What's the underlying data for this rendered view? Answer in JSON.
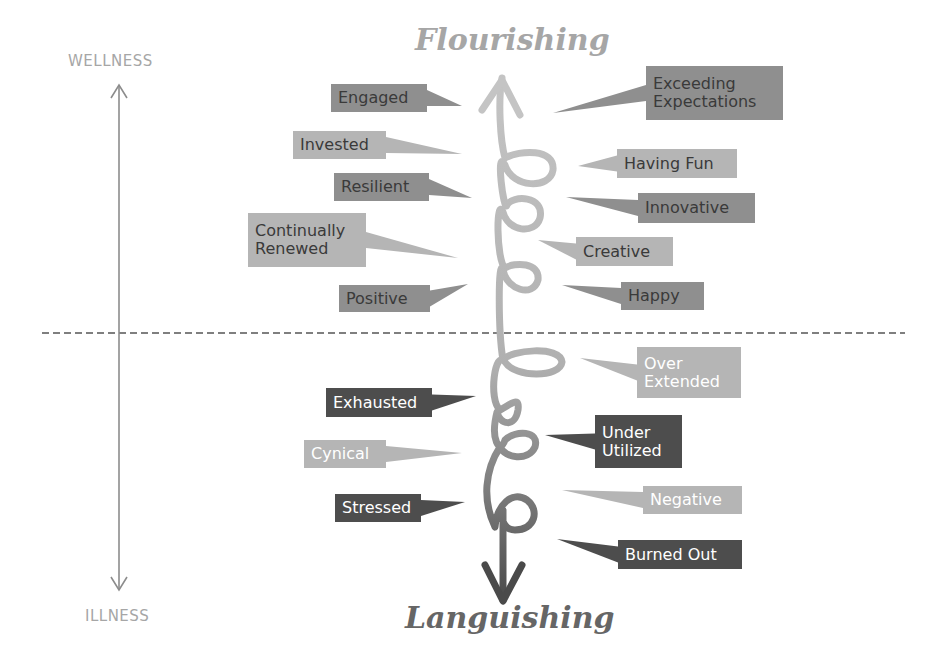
{
  "diagram": {
    "type": "wellness-illness-continuum",
    "top_title": "Flourishing",
    "bottom_title": "Languishing",
    "axis": {
      "top_label": "WELLNESS",
      "bottom_label": "ILLNESS"
    },
    "colors": {
      "top_title": "#a6a6a6",
      "bottom_title": "#666666",
      "axis": "#8c8c8c",
      "dashed_divider": "#7f7f7f",
      "spiral_top": "#bdbdbd",
      "spiral_bottom": "#4d4d4d"
    },
    "positive_labels": [
      {
        "id": "engaged",
        "lines": [
          "Engaged"
        ],
        "side": "left",
        "bg": "#8f8f8f",
        "fg": "#3a3a3a",
        "box": [
          331,
          84,
          96,
          28
        ],
        "tip": [
          462,
          106
        ]
      },
      {
        "id": "invested",
        "lines": [
          "Invested"
        ],
        "side": "left",
        "bg": "#b5b5b5",
        "fg": "#3a3a3a",
        "box": [
          293,
          131,
          93,
          28
        ],
        "tip": [
          462,
          154
        ]
      },
      {
        "id": "resilient",
        "lines": [
          "Resilient"
        ],
        "side": "left",
        "bg": "#8f8f8f",
        "fg": "#3a3a3a",
        "box": [
          334,
          173,
          95,
          28
        ],
        "tip": [
          472,
          198
        ]
      },
      {
        "id": "continually-renewed",
        "lines": [
          "Continually",
          "Renewed"
        ],
        "side": "left",
        "bg": "#b5b5b5",
        "fg": "#3a3a3a",
        "box": [
          248,
          213,
          118,
          54
        ],
        "tip": [
          458,
          258
        ]
      },
      {
        "id": "positive",
        "lines": [
          "Positive"
        ],
        "side": "left",
        "bg": "#8f8f8f",
        "fg": "#3a3a3a",
        "box": [
          339,
          285,
          91,
          27
        ],
        "tip": [
          468,
          284
        ]
      },
      {
        "id": "exceeding-expectations",
        "lines": [
          "Exceeding",
          "Expectations"
        ],
        "side": "right",
        "bg": "#8f8f8f",
        "fg": "#3a3a3a",
        "box": [
          646,
          66,
          137,
          54
        ],
        "tip": [
          553,
          113
        ]
      },
      {
        "id": "having-fun",
        "lines": [
          "Having Fun"
        ],
        "side": "right",
        "bg": "#b5b5b5",
        "fg": "#3a3a3a",
        "box": [
          617,
          149,
          120,
          29
        ],
        "tip": [
          578,
          166
        ]
      },
      {
        "id": "innovative",
        "lines": [
          "Innovative"
        ],
        "side": "right",
        "bg": "#8f8f8f",
        "fg": "#3a3a3a",
        "box": [
          638,
          193,
          117,
          30
        ],
        "tip": [
          566,
          197
        ]
      },
      {
        "id": "creative",
        "lines": [
          "Creative"
        ],
        "side": "right",
        "bg": "#b5b5b5",
        "fg": "#3a3a3a",
        "box": [
          576,
          237,
          97,
          29
        ],
        "tip": [
          538,
          240
        ]
      },
      {
        "id": "happy",
        "lines": [
          "Happy"
        ],
        "side": "right",
        "bg": "#8f8f8f",
        "fg": "#3a3a3a",
        "box": [
          621,
          282,
          83,
          28
        ],
        "tip": [
          562,
          285
        ]
      }
    ],
    "negative_labels": [
      {
        "id": "exhausted",
        "lines": [
          "Exhausted"
        ],
        "side": "left",
        "bg": "#4d4d4d",
        "fg": "#ffffff",
        "box": [
          326,
          388,
          106,
          29
        ],
        "tip": [
          476,
          396
        ]
      },
      {
        "id": "cynical",
        "lines": [
          "Cynical"
        ],
        "side": "left",
        "bg": "#b5b5b5",
        "fg": "#ffffff",
        "box": [
          304,
          440,
          82,
          28
        ],
        "tip": [
          462,
          453
        ]
      },
      {
        "id": "stressed",
        "lines": [
          "Stressed"
        ],
        "side": "left",
        "bg": "#4d4d4d",
        "fg": "#ffffff",
        "box": [
          335,
          494,
          86,
          28
        ],
        "tip": [
          465,
          502
        ]
      },
      {
        "id": "over-extended",
        "lines": [
          "Over",
          "Extended"
        ],
        "side": "right",
        "bg": "#b5b5b5",
        "fg": "#ffffff",
        "box": [
          637,
          347,
          104,
          51
        ],
        "tip": [
          580,
          358
        ]
      },
      {
        "id": "under-utilized",
        "lines": [
          "Under",
          "Utilized"
        ],
        "side": "right",
        "bg": "#4d4d4d",
        "fg": "#ffffff",
        "box": [
          595,
          415,
          87,
          53
        ],
        "tip": [
          545,
          435
        ]
      },
      {
        "id": "negative",
        "lines": [
          "Negative"
        ],
        "side": "right",
        "bg": "#b5b5b5",
        "fg": "#ffffff",
        "box": [
          643,
          486,
          99,
          28
        ],
        "tip": [
          562,
          490
        ]
      },
      {
        "id": "burned-out",
        "lines": [
          "Burned Out"
        ],
        "side": "right",
        "bg": "#4d4d4d",
        "fg": "#ffffff",
        "box": [
          618,
          540,
          124,
          29
        ],
        "tip": [
          557,
          539
        ]
      }
    ]
  }
}
